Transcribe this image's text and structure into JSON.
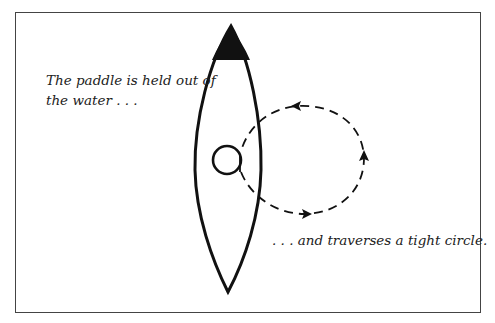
{
  "captions": {
    "top_left": [
      "The paddle is held out of",
      "the water . . ."
    ],
    "bottom_right": ". . . and  traverses a tight circle."
  },
  "colors": {
    "ink": "#111111",
    "frame": "#444444",
    "background": "#ffffff"
  },
  "diagram": {
    "boat": {
      "tip": [
        231,
        26
      ],
      "stern": [
        228,
        292
      ],
      "max_width_x": [
        195,
        261
      ],
      "bow_fill_y": 60
    },
    "paddle_circle": {
      "cx": 227,
      "cy": 160,
      "r": 14
    },
    "loop": {
      "style": "dashed",
      "direction": "clockwise-from-paddle",
      "arrows": [
        "right (bottom)",
        "up (right side)",
        "left (top)"
      ]
    }
  }
}
